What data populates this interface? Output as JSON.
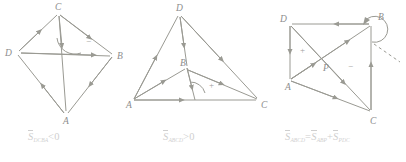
{
  "figure": {
    "stroke_color": "#9a9a93",
    "label_color": "#8d8d8d",
    "caption_color": "#cfcfcf",
    "background": "#ffffff"
  },
  "panels": [
    {
      "id": "panel-1",
      "name": "crossed-quadrilateral-negative",
      "shape": "quadrilateral",
      "vertices": [
        {
          "label": "C",
          "x": 59,
          "y": 12
        },
        {
          "label": "B",
          "x": 113,
          "y": 55
        },
        {
          "label": "A",
          "x": 66,
          "y": 114
        },
        {
          "label": "D",
          "x": 17,
          "y": 52
        }
      ],
      "diagonals": [
        {
          "from": "D",
          "to": "B"
        },
        {
          "from": "C",
          "to": "A"
        }
      ],
      "sign": "−",
      "sign_x": 78,
      "sign_y": 42,
      "caption": {
        "symbol": "S",
        "subscript": "DCBA",
        "relation": "<0"
      }
    },
    {
      "id": "panel-2",
      "name": "triangle-fan-positive",
      "shape": "triangle",
      "vertices": [
        {
          "label": "D",
          "x": 179,
          "y": 13
        },
        {
          "label": "C",
          "x": 258,
          "y": 99
        },
        {
          "label": "A",
          "x": 132,
          "y": 100
        },
        {
          "label": "B",
          "x": 186,
          "y": 68
        }
      ],
      "diagonals": [
        {
          "from": "D",
          "to": "B"
        },
        {
          "from": "B",
          "to": "C"
        },
        {
          "from": "A",
          "to": "B"
        }
      ],
      "sign": "+",
      "sign_x": 212,
      "sign_y": 85,
      "caption": {
        "symbol": "S",
        "subscript": "ABCD",
        "relation": ">0"
      }
    },
    {
      "id": "panel-3",
      "name": "quadrilateral-decomposition",
      "shape": "quadrilateral",
      "vertices": [
        {
          "label": "D",
          "x": 290,
          "y": 24
        },
        {
          "label": "B",
          "x": 371,
          "y": 24
        },
        {
          "label": "C",
          "x": 371,
          "y": 112
        },
        {
          "label": "A",
          "x": 290,
          "y": 80
        }
      ],
      "intersection": {
        "label": "P",
        "x": 324,
        "y": 67
      },
      "diagonals": [
        {
          "from": "A",
          "to": "B"
        },
        {
          "from": "D",
          "to": "C"
        }
      ],
      "signs": [
        {
          "text": "+",
          "x": 303,
          "y": 50
        },
        {
          "text": "−",
          "x": 350,
          "y": 66
        }
      ],
      "loop_arrow_at": "B",
      "caption": {
        "symbol": "S",
        "subscript": "ABCD",
        "relation": "=",
        "symbol2": "S",
        "subscript2": "ABP",
        "operator": "+",
        "symbol3": "S",
        "subscript3": "PDC"
      }
    }
  ]
}
